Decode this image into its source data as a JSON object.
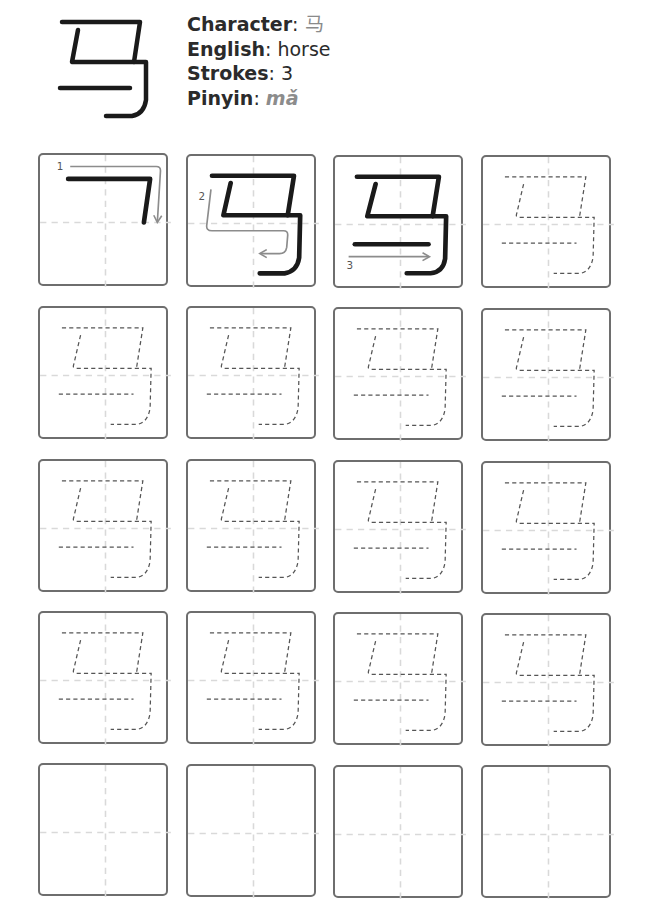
{
  "header": {
    "character_label": "Character",
    "character_value": "马",
    "english_label": "English",
    "english_value": "horse",
    "strokes_label": "Strokes",
    "strokes_value": "3",
    "pinyin_label": "Pinyin",
    "pinyin_value": "mǎ",
    "separator": ": "
  },
  "colors": {
    "ink": "#1a1a1a",
    "guide": "#8c8c8c",
    "box_border": "#6e6e6e",
    "gridline": "#d6d6d6",
    "trace": "#555555"
  },
  "stroke_order": {
    "step_labels": [
      "1",
      "2",
      "3"
    ]
  },
  "practice_grid": {
    "rows": 5,
    "columns": 4,
    "cells": [
      {
        "type": "stroke-1"
      },
      {
        "type": "stroke-2"
      },
      {
        "type": "stroke-3"
      },
      {
        "type": "trace"
      },
      {
        "type": "trace"
      },
      {
        "type": "trace"
      },
      {
        "type": "trace"
      },
      {
        "type": "trace"
      },
      {
        "type": "trace"
      },
      {
        "type": "trace"
      },
      {
        "type": "trace"
      },
      {
        "type": "trace"
      },
      {
        "type": "trace"
      },
      {
        "type": "trace"
      },
      {
        "type": "trace"
      },
      {
        "type": "trace"
      },
      {
        "type": "blank"
      },
      {
        "type": "blank"
      },
      {
        "type": "blank"
      },
      {
        "type": "blank"
      }
    ]
  }
}
